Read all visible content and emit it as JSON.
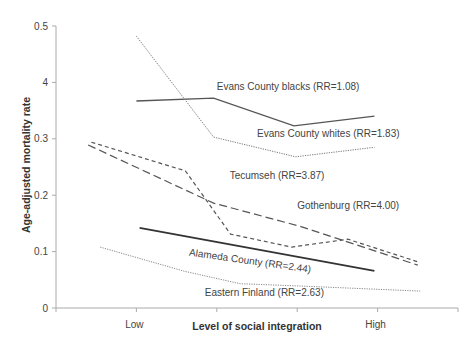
{
  "chart_data": {
    "type": "line",
    "title": "",
    "xlabel": "Level of social integration",
    "ylabel": "Age-adjusted mortality rate",
    "xlim": [
      0,
      5
    ],
    "ylim": [
      0,
      0.5
    ],
    "x_ticks": [
      0,
      1,
      2,
      3,
      4,
      5
    ],
    "x_tick_labels": [
      {
        "x": 1,
        "label": "Low"
      },
      {
        "x": 4,
        "label": "High"
      }
    ],
    "y_ticks": [
      {
        "value": 0,
        "label": "0"
      },
      {
        "value": 0.1,
        "label": "0.1"
      },
      {
        "value": 0.2,
        "label": "0.2"
      },
      {
        "value": 0.3,
        "label": "0.3"
      },
      {
        "value": 0.4,
        "label": "4"
      },
      {
        "value": 0.5,
        "label": "0.5"
      }
    ],
    "grid": false,
    "legend": "inline labels",
    "series": [
      {
        "name": "Evans County blacks (RR=1.08)",
        "style": "solid",
        "color": "#555555",
        "points": [
          [
            1.0,
            0.367
          ],
          [
            1.96,
            0.372
          ],
          [
            2.96,
            0.323
          ],
          [
            3.96,
            0.34
          ]
        ],
        "label_at": [
          2.0,
          0.386
        ]
      },
      {
        "name": "Evans County whites (RR=1.83)",
        "style": "dotted",
        "color": "#777777",
        "points": [
          [
            1.0,
            0.482
          ],
          [
            1.96,
            0.303
          ],
          [
            2.98,
            0.268
          ],
          [
            3.96,
            0.285
          ]
        ],
        "label_at": [
          2.5,
          0.303
        ]
      },
      {
        "name": "Tecumseh (RR=3.87)",
        "style": "short-dash",
        "color": "#555555",
        "points": [
          [
            0.44,
            0.294
          ],
          [
            1.61,
            0.243
          ],
          [
            2.17,
            0.131
          ],
          [
            2.93,
            0.108
          ],
          [
            3.63,
            0.122
          ],
          [
            4.5,
            0.082
          ]
        ],
        "label_at": [
          2.16,
          0.228
        ]
      },
      {
        "name": "Gothenburg (RR=4.00)",
        "style": "long-dash",
        "color": "#555555",
        "points": [
          [
            0.4,
            0.289
          ],
          [
            1.96,
            0.186
          ],
          [
            3.03,
            0.145
          ],
          [
            4.5,
            0.076
          ]
        ],
        "label_at": [
          3.0,
          0.176
        ]
      },
      {
        "name": "Alameda County (RR=2.44)",
        "style": "solid-thick",
        "color": "#333333",
        "points": [
          [
            1.04,
            0.142
          ],
          [
            3.96,
            0.066
          ]
        ],
        "label_at": [
          1.65,
          0.093
        ]
      },
      {
        "name": "Eastern Finland (RR=2.63)",
        "style": "dotted",
        "color": "#888888",
        "points": [
          [
            0.55,
            0.108
          ],
          [
            1.6,
            0.065
          ],
          [
            2.29,
            0.043
          ],
          [
            3.03,
            0.039
          ],
          [
            4.53,
            0.03
          ]
        ],
        "label_at": [
          1.85,
          0.021
        ]
      }
    ]
  }
}
